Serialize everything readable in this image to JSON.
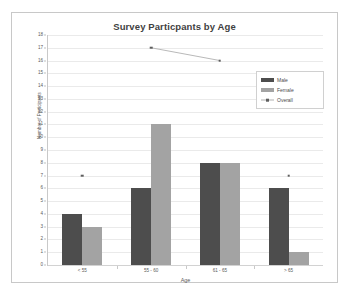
{
  "chart_data": {
    "type": "bar",
    "title": "Survey Particpants by Age",
    "xlabel": "Age",
    "ylabel": "Number of Participants",
    "categories": [
      "< 55",
      "55 - 60",
      "61 - 65",
      "> 65"
    ],
    "series": [
      {
        "name": "Male",
        "type": "bar",
        "color": "#4d4d4d",
        "values": [
          4,
          6,
          8,
          6
        ]
      },
      {
        "name": "Female",
        "type": "bar",
        "color": "#a3a3a3",
        "values": [
          3,
          11,
          8,
          1
        ]
      },
      {
        "name": "Overall",
        "type": "scatter",
        "color": "#5e5e5e",
        "values": [
          7,
          17,
          16,
          7
        ]
      }
    ],
    "ylim": [
      0,
      18
    ],
    "yticks": [
      0,
      1,
      2,
      3,
      4,
      5,
      6,
      7,
      8,
      9,
      10,
      11,
      12,
      13,
      14,
      15,
      16,
      17,
      18
    ],
    "grid": true,
    "legend_position": "upper right"
  },
  "legend": {
    "items": [
      {
        "label": "Male"
      },
      {
        "label": "Female"
      },
      {
        "label": "Overall"
      }
    ]
  }
}
